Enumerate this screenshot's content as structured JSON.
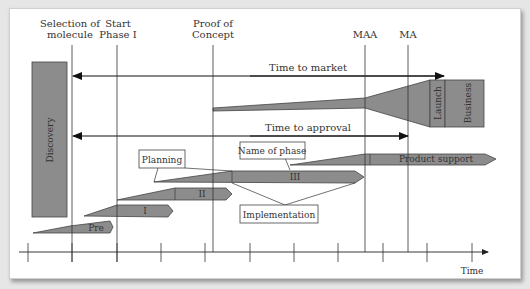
{
  "milestones": {
    "selection_of_molecule": [
      "Selection of",
      "molecule"
    ],
    "start_phase_1": [
      "Start",
      "Phase I"
    ],
    "proof_of_concept": [
      "Proof of",
      "Concept"
    ],
    "maa": "MAA",
    "ma": "MA"
  },
  "arrows": {
    "time_to_market": "Time to market",
    "time_to_approval": "Time to approval"
  },
  "blocks": {
    "discovery": "Discovery",
    "launch": "Launch",
    "business": "Business"
  },
  "phases": {
    "pre": "Pre",
    "phase_1": "I",
    "phase_2": "II",
    "phase_3": "III",
    "product_support": "Product support"
  },
  "callouts": {
    "planning": "Planning",
    "name_of_phase": "Name of phase",
    "implementation": "Implementation"
  },
  "axis": {
    "label": "Time"
  },
  "colors": {
    "fill": "#8c8c8c",
    "stroke": "#444444",
    "line": "#333333"
  }
}
